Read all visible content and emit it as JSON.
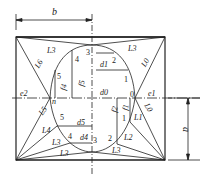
{
  "diagram": {
    "type": "geometric construction / development drawing",
    "dimensions": {
      "b": "b",
      "a": "a"
    },
    "points": [
      "0",
      "1",
      "2",
      "3",
      "4",
      "5",
      "n"
    ],
    "line_labels": {
      "L0_top": "L0",
      "L0_bottom": "L0",
      "L1": "L1",
      "L2": "L2",
      "L3_top_left": "L3",
      "L3_top_right": "L3",
      "L3_bottom_left": "L3",
      "L3_bottom_right": "L3",
      "L4": "L4",
      "L5": "L5",
      "L6": "L6"
    },
    "offset_labels": {
      "d0": "d0",
      "d1": "d1",
      "d4": "d4",
      "d5": "d5",
      "f1": "f1",
      "f2": "f2",
      "f3": "f3",
      "f4": "f4",
      "f5": "f5",
      "e1": "e1",
      "e2": "e2"
    }
  }
}
